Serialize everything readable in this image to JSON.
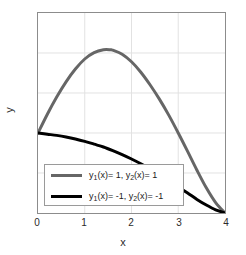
{
  "chart_data": {
    "type": "line",
    "title": "",
    "xlabel": "x",
    "ylabel": "y",
    "xlim": [
      0,
      4
    ],
    "ylim": [
      -2,
      3
    ],
    "xticks": [
      "0",
      "1",
      "2",
      "3",
      "4"
    ],
    "yticks": [
      "3",
      "2",
      "1",
      "0",
      "-1",
      "-2"
    ],
    "grid": true,
    "legend_position": "lower left",
    "series": [
      {
        "name": "y_1(x)=  1, y_2(x)=  1",
        "color": "#666666",
        "linewidth": 3,
        "x": [
          0,
          0.2,
          0.4,
          0.6,
          0.8,
          1.0,
          1.2,
          1.4,
          1.55,
          1.6,
          1.8,
          2.0,
          2.2,
          2.4,
          2.6,
          2.8,
          3.0,
          3.2,
          3.4,
          3.6,
          3.8,
          4.0
        ],
        "y": [
          0,
          0.47,
          0.9,
          1.28,
          1.6,
          1.85,
          2.01,
          2.08,
          2.08,
          2.07,
          1.97,
          1.78,
          1.52,
          1.2,
          0.84,
          0.44,
          0.0,
          -0.46,
          -0.93,
          -1.37,
          -1.74,
          -2.0
        ]
      },
      {
        "name": "y_1(x)= -1, y_2(x)= -1",
        "color": "#000000",
        "linewidth": 3,
        "x": [
          0,
          0.2,
          0.4,
          0.6,
          0.8,
          1.0,
          1.2,
          1.4,
          1.6,
          1.8,
          2.0,
          2.2,
          2.4,
          2.6,
          2.8,
          3.0,
          3.2,
          3.4,
          3.6,
          3.8,
          4.0
        ],
        "y": [
          0,
          -0.03,
          -0.06,
          -0.1,
          -0.15,
          -0.21,
          -0.28,
          -0.35,
          -0.44,
          -0.54,
          -0.65,
          -0.77,
          -0.9,
          -1.04,
          -1.19,
          -1.35,
          -1.5,
          -1.66,
          -1.8,
          -1.92,
          -2.0
        ]
      }
    ]
  },
  "axes": {
    "xlabel": "x",
    "ylabel": "y",
    "xticks": [
      {
        "value": 0,
        "label": "0"
      },
      {
        "value": 1,
        "label": "1"
      },
      {
        "value": 2,
        "label": "2"
      },
      {
        "value": 3,
        "label": "3"
      },
      {
        "value": 4,
        "label": "4"
      }
    ],
    "yticks": [
      {
        "value": 3,
        "label": "3"
      },
      {
        "value": 2,
        "label": "2"
      },
      {
        "value": 1,
        "label": "1"
      },
      {
        "value": 0,
        "label": "0"
      },
      {
        "value": -1,
        "label": "-1"
      },
      {
        "value": -2,
        "label": "-2"
      }
    ]
  },
  "legend": {
    "entries": [
      {
        "prefix1": "y",
        "sub1": "1",
        "mid": "(x)=  1, ",
        "prefix2": "y",
        "sub2": "2",
        "suffix": "(x)=  1",
        "color": "#666666"
      },
      {
        "prefix1": "y",
        "sub1": "1",
        "mid": "(x)= -1, ",
        "prefix2": "y",
        "sub2": "2",
        "suffix": "(x)= -1",
        "color": "#000000"
      }
    ]
  },
  "colors": {
    "series1": "#666666",
    "series2": "#000000",
    "grid": "#e2e2e2",
    "axis": "#8c8c8c",
    "text": "#2b2b2b"
  }
}
